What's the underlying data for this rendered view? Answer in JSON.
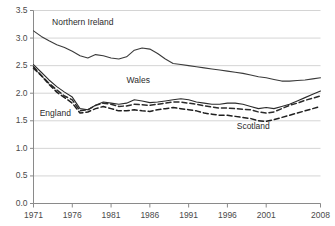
{
  "chart_data": {
    "type": "line",
    "title": "",
    "subtitle": "",
    "xlabel": "",
    "ylabel": "",
    "xlim": [
      1971,
      2008
    ],
    "ylim": [
      0.0,
      3.5
    ],
    "grid": true,
    "legend_position": "inline-annotations",
    "x": [
      1971,
      1972,
      1973,
      1974,
      1975,
      1976,
      1977,
      1978,
      1979,
      1980,
      1981,
      1982,
      1983,
      1984,
      1985,
      1986,
      1987,
      1988,
      1989,
      1990,
      1991,
      1992,
      1993,
      1994,
      1995,
      1996,
      1997,
      1998,
      1999,
      2000,
      2001,
      2002,
      2003,
      2004,
      2005,
      2006,
      2007,
      2008
    ],
    "ytick_labels": [
      "0.0",
      "0.5",
      "1.0",
      "1.5",
      "2.0",
      "2.5",
      "3.0",
      "3.5"
    ],
    "ytick_values": [
      0.0,
      0.5,
      1.0,
      1.5,
      2.0,
      2.5,
      3.0,
      3.5
    ],
    "xtick_labels": [
      "1971",
      "1976",
      "1981",
      "1986",
      "1991",
      "1996",
      "2001",
      "2008"
    ],
    "xtick_values": [
      1971,
      1976,
      1981,
      1986,
      1991,
      1996,
      2001,
      2008
    ],
    "series": [
      {
        "name": "Northern Ireland",
        "style": "solid",
        "color": "#3a3a3a",
        "label_x": 1973.4,
        "label_y": 3.27,
        "values": [
          3.13,
          3.03,
          2.95,
          2.88,
          2.83,
          2.76,
          2.68,
          2.64,
          2.7,
          2.68,
          2.64,
          2.62,
          2.66,
          2.78,
          2.82,
          2.8,
          2.72,
          2.62,
          2.54,
          2.52,
          2.5,
          2.48,
          2.46,
          2.44,
          2.42,
          2.4,
          2.38,
          2.36,
          2.33,
          2.3,
          2.28,
          2.25,
          2.22,
          2.22,
          2.23,
          2.24,
          2.26,
          2.28
        ]
      },
      {
        "name": "Wales",
        "style": "solid",
        "color": "#2b2b2b",
        "label_x": 1983.0,
        "label_y": 2.22,
        "values": [
          2.52,
          2.38,
          2.24,
          2.12,
          2.02,
          1.93,
          1.72,
          1.7,
          1.78,
          1.84,
          1.82,
          1.8,
          1.82,
          1.88,
          1.86,
          1.83,
          1.84,
          1.86,
          1.88,
          1.9,
          1.88,
          1.84,
          1.82,
          1.8,
          1.8,
          1.82,
          1.82,
          1.8,
          1.76,
          1.72,
          1.74,
          1.72,
          1.76,
          1.8,
          1.86,
          1.92,
          1.98,
          2.04
        ]
      },
      {
        "name": "England",
        "style": "dashed",
        "color": "#2b2b2b",
        "label_x": 1971.8,
        "label_y": 1.62,
        "values": [
          2.45,
          2.32,
          2.18,
          2.06,
          1.95,
          1.88,
          1.68,
          1.7,
          1.78,
          1.82,
          1.8,
          1.76,
          1.77,
          1.8,
          1.79,
          1.78,
          1.8,
          1.82,
          1.84,
          1.84,
          1.82,
          1.8,
          1.77,
          1.75,
          1.73,
          1.73,
          1.72,
          1.71,
          1.7,
          1.66,
          1.64,
          1.66,
          1.72,
          1.78,
          1.82,
          1.87,
          1.91,
          1.95
        ]
      },
      {
        "name": "Scotland",
        "style": "dashed",
        "color": "#1f1f1f",
        "label_x": 1997.2,
        "label_y": 1.38,
        "values": [
          2.48,
          2.32,
          2.16,
          2.02,
          1.92,
          1.82,
          1.64,
          1.66,
          1.72,
          1.76,
          1.72,
          1.68,
          1.68,
          1.7,
          1.68,
          1.67,
          1.7,
          1.72,
          1.74,
          1.72,
          1.7,
          1.68,
          1.64,
          1.62,
          1.6,
          1.6,
          1.58,
          1.56,
          1.54,
          1.5,
          1.49,
          1.52,
          1.56,
          1.6,
          1.64,
          1.68,
          1.72,
          1.76
        ]
      }
    ]
  },
  "axis": {
    "axis_color": "#8a8a8a",
    "grid_color": "#c9c9c9"
  }
}
